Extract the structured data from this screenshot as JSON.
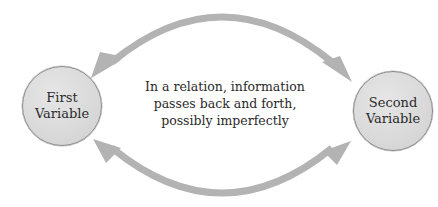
{
  "diagram": {
    "nodes": [
      {
        "id": "first",
        "label": "First\nVariable"
      },
      {
        "id": "second",
        "label": "Second\nVariable"
      }
    ],
    "caption": {
      "lines": [
        "In a relation, information",
        "passes back and forth,",
        "possibly imperfectly"
      ]
    },
    "arrows": [
      {
        "path": "top-arc",
        "from": "first",
        "to": "second",
        "bidirectional": true
      },
      {
        "path": "bottom-arc",
        "from": "second",
        "to": "first",
        "bidirectional": true
      }
    ],
    "colors": {
      "arrow": "#b3b3b3",
      "node_fill": "#dcdcdc",
      "node_border": "#8a8a8a",
      "text": "#2a2a2a"
    }
  }
}
